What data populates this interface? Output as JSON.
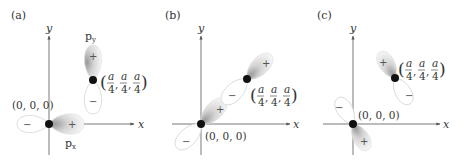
{
  "panels": [
    {
      "id": "a",
      "label": "(a)",
      "axes": {
        "x": "x",
        "y": "y"
      },
      "origin_label": "(0, 0, 0)",
      "site_label": {
        "open": "(",
        "frac": "a/4",
        "num": "a",
        "den": "4",
        "close": ")",
        "sep": ","
      },
      "orbitals": [
        {
          "name": "px",
          "label": "p",
          "sub": "x",
          "pos_lobe": "+",
          "neg_lobe": "−"
        },
        {
          "name": "py",
          "label": "p",
          "sub": "y",
          "pos_lobe": "+",
          "neg_lobe": "−"
        }
      ]
    },
    {
      "id": "b",
      "label": "(b)",
      "axes": {
        "x": "x",
        "y": "y"
      },
      "origin_label": "(0, 0, 0)",
      "lobes": {
        "origin_pos": "+",
        "origin_neg": "−",
        "site_pos": "+",
        "site_neg": "−"
      }
    },
    {
      "id": "c",
      "label": "(c)",
      "axes": {
        "x": "x",
        "y": "y"
      },
      "origin_label": "(0, 0, 0)",
      "lobes": {
        "origin_pos": "+",
        "origin_neg": "−",
        "site_pos": "+",
        "site_neg": "−"
      }
    }
  ],
  "colors": {
    "axis": "#555555",
    "lobe_outline": "#d8d8d8",
    "lobe_shade": "#bdbdbd",
    "dot": "#111111"
  }
}
